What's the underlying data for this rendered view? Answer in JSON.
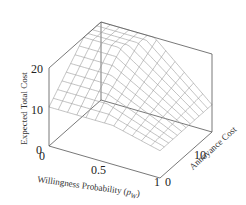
{
  "chart_data": {
    "type": "surface3d",
    "title": "",
    "xlabel": "Willingness Probability (p_W)",
    "ylabel": "Annoyance Cost",
    "zlabel": "Expected Total Cost",
    "x_ticks": [
      "0",
      "0.5",
      "1"
    ],
    "y_ticks": [
      "0",
      "10"
    ],
    "z_ticks": [
      "0",
      "10",
      "20"
    ],
    "xlim": [
      0,
      1
    ],
    "ylim": [
      0,
      20
    ],
    "zlim": [
      0,
      20
    ],
    "grid": false,
    "legend": null,
    "surface_description": "Wireframe mesh surface; cost rises with annoyance cost and falls with willingness probability, forming a folded ridge (piecewise minimum) across the domain",
    "mesh_resolution": [
      12,
      12
    ]
  },
  "labels": {
    "z_axis_title": "Expected Total Cost",
    "x_axis_title_main": "Willingness Probability (",
    "x_axis_title_sym": "p",
    "x_axis_title_sub": "W",
    "x_axis_title_close": ")",
    "y_axis_title": "Annoyance Cost",
    "z_tick_20": "20",
    "z_tick_10": "10",
    "z_tick_0": "0",
    "x_tick_0": "0",
    "x_tick_05": "0.5",
    "x_tick_1": "1",
    "y_tick_0": "0",
    "y_tick_10": "10"
  },
  "colors": {
    "box": "#555555",
    "mesh": "#9a9a9a",
    "text": "#222222"
  }
}
